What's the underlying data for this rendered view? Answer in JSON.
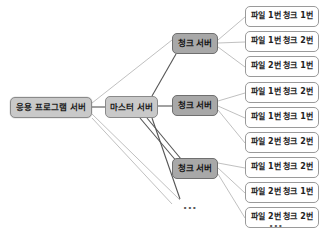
{
  "diagram": {
    "colors": {
      "app_server_fill": "#c9c9c9",
      "master_server_fill": "#c9c9c9",
      "chunk_server_fill": "#a8a8a8",
      "file_box_fill": "#ffffff",
      "edge_dark": "#555555",
      "edge_light": "#b9b9b9",
      "border": "#8a8a8a",
      "background": "#ffffff"
    },
    "app_server": {
      "label": "응용 프로그램 서버",
      "x": 10,
      "y": 97,
      "w": 82,
      "h": 21
    },
    "master_server": {
      "label": "마스터 서버",
      "x": 105,
      "y": 96,
      "w": 53,
      "h": 22
    },
    "chunk_servers": [
      {
        "label": "청크 서버",
        "x": 172,
        "y": 33,
        "w": 46,
        "h": 21
      },
      {
        "label": "청크 서버",
        "x": 172,
        "y": 95,
        "w": 46,
        "h": 21
      },
      {
        "label": "청크 서버",
        "x": 172,
        "y": 158,
        "w": 46,
        "h": 21
      }
    ],
    "file_boxes": [
      {
        "label": "파일 1번 청크 1번",
        "x": 245,
        "y": 6,
        "w": 74,
        "h": 21,
        "group": 0
      },
      {
        "label": "파일 1번 청크 2번",
        "x": 245,
        "y": 31,
        "w": 74,
        "h": 21,
        "group": 0
      },
      {
        "label": "파일 2번 청크 1번",
        "x": 245,
        "y": 56,
        "w": 74,
        "h": 21,
        "group": 0
      },
      {
        "label": "파일 1번 청크 2번",
        "x": 245,
        "y": 82,
        "w": 74,
        "h": 21,
        "group": 1
      },
      {
        "label": "파일 1번 청크 1번",
        "x": 245,
        "y": 107,
        "w": 74,
        "h": 21,
        "group": 1
      },
      {
        "label": "파일 2번 청크 2번",
        "x": 245,
        "y": 132,
        "w": 74,
        "h": 21,
        "group": 1
      },
      {
        "label": "파일 1번 청크 2번",
        "x": 245,
        "y": 157,
        "w": 74,
        "h": 21,
        "group": 2
      },
      {
        "label": "파일 2번 청크 1번",
        "x": 245,
        "y": 182,
        "w": 74,
        "h": 21,
        "group": 2
      },
      {
        "label": "파일 2번 청크 2번",
        "x": 245,
        "y": 207,
        "w": 74,
        "h": 21,
        "group": 2
      }
    ],
    "ellipses": [
      {
        "label": "...",
        "x": 183,
        "y": 200
      },
      {
        "label": "...",
        "x": 269,
        "y": 218
      }
    ],
    "edges": [
      {
        "from": "app-server",
        "to": "master-server",
        "x1": 92,
        "y1": 107,
        "x2": 105,
        "y2": 107,
        "tone": "dark"
      },
      {
        "from": "app-server",
        "to": "chunk-server-1",
        "x1": 92,
        "y1": 103,
        "x2": 172,
        "y2": 40,
        "tone": "light"
      },
      {
        "from": "app-server",
        "to": "ellipsis-1",
        "x1": 92,
        "y1": 114,
        "x2": 180,
        "y2": 200,
        "tone": "light"
      },
      {
        "from": "app-server",
        "to": "ellipsis-1b",
        "x1": 92,
        "y1": 118,
        "x2": 172,
        "y2": 204,
        "tone": "light"
      },
      {
        "from": "master-server",
        "to": "chunk-server-1",
        "x1": 152,
        "y1": 96,
        "x2": 176,
        "y2": 54,
        "tone": "dark"
      },
      {
        "from": "master-server",
        "to": "chunk-server-2",
        "x1": 158,
        "y1": 106,
        "x2": 172,
        "y2": 106,
        "tone": "dark"
      },
      {
        "from": "master-server",
        "to": "chunk-server-3",
        "x1": 140,
        "y1": 118,
        "x2": 178,
        "y2": 163,
        "tone": "dark"
      },
      {
        "from": "master-server",
        "to": "chunk-server-3b",
        "x1": 147,
        "y1": 118,
        "x2": 186,
        "y2": 165,
        "tone": "dark"
      },
      {
        "from": "master-server",
        "to": "ellipsis-1",
        "x1": 152,
        "y1": 118,
        "x2": 180,
        "y2": 199,
        "tone": "dark"
      },
      {
        "from": "chunk-server-1",
        "to": "file-1",
        "x1": 218,
        "y1": 40,
        "x2": 245,
        "y2": 17,
        "tone": "light"
      },
      {
        "from": "chunk-server-1",
        "to": "file-2",
        "x1": 218,
        "y1": 43,
        "x2": 245,
        "y2": 42,
        "tone": "light"
      },
      {
        "from": "chunk-server-1",
        "to": "file-3",
        "x1": 218,
        "y1": 47,
        "x2": 245,
        "y2": 67,
        "tone": "light"
      },
      {
        "from": "chunk-server-2",
        "to": "file-4",
        "x1": 218,
        "y1": 101,
        "x2": 245,
        "y2": 93,
        "tone": "light"
      },
      {
        "from": "chunk-server-2",
        "to": "file-5",
        "x1": 218,
        "y1": 106,
        "x2": 245,
        "y2": 118,
        "tone": "light"
      },
      {
        "from": "chunk-server-2",
        "to": "file-6",
        "x1": 218,
        "y1": 110,
        "x2": 245,
        "y2": 143,
        "tone": "light"
      },
      {
        "from": "chunk-server-3",
        "to": "file-7",
        "x1": 218,
        "y1": 163,
        "x2": 245,
        "y2": 168,
        "tone": "light"
      },
      {
        "from": "chunk-server-3",
        "to": "file-8",
        "x1": 218,
        "y1": 168,
        "x2": 245,
        "y2": 193,
        "tone": "light"
      },
      {
        "from": "chunk-server-3",
        "to": "file-9",
        "x1": 218,
        "y1": 174,
        "x2": 245,
        "y2": 218,
        "tone": "light"
      }
    ]
  }
}
